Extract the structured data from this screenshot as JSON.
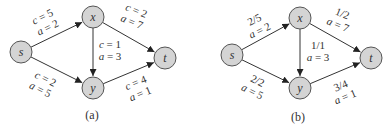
{
  "diagrams": [
    {
      "id": "a",
      "caption": "(a)",
      "caption_pos": [
        92,
        119
      ],
      "nodes": [
        {
          "id": "s",
          "label": "s",
          "x": 21,
          "y": 52
        },
        {
          "id": "x",
          "label": "x",
          "x": 93,
          "y": 17
        },
        {
          "id": "y",
          "label": "y",
          "x": 93,
          "y": 88
        },
        {
          "id": "t",
          "label": "t",
          "x": 165,
          "y": 58
        }
      ],
      "edges": [
        {
          "from": "s",
          "to": "x",
          "line1": "c = 5",
          "line2": "a = 2",
          "label_pos": [
            44,
            20
          ],
          "rotate": -26
        },
        {
          "from": "s",
          "to": "y",
          "line1": "c = 2",
          "line2": "a = 5",
          "label_pos": [
            44,
            82
          ],
          "rotate": 26
        },
        {
          "from": "x",
          "to": "y",
          "line1": "c = 1",
          "line2": "a = 3",
          "label_pos": [
            110,
            48
          ],
          "rotate": 0
        },
        {
          "from": "x",
          "to": "t",
          "line1": "c = 2",
          "line2": "a = 7",
          "label_pos": [
            135,
            14
          ],
          "rotate": 22
        },
        {
          "from": "y",
          "to": "t",
          "line1": "c = 4",
          "line2": "a = 1",
          "label_pos": [
            137,
            86
          ],
          "rotate": -22
        }
      ]
    },
    {
      "id": "b",
      "caption": "(b)",
      "caption_pos": [
        298,
        121
      ],
      "nodes": [
        {
          "id": "s",
          "label": "s",
          "x": 232,
          "y": 55
        },
        {
          "id": "x",
          "label": "x",
          "x": 300,
          "y": 18
        },
        {
          "id": "y",
          "label": "y",
          "x": 300,
          "y": 88
        },
        {
          "id": "t",
          "label": "t",
          "x": 371,
          "y": 58
        }
      ],
      "edges": [
        {
          "from": "s",
          "to": "x",
          "line1": "2/5",
          "line2": "a = 2",
          "label_pos": [
            256,
            23
          ],
          "rotate": -26
        },
        {
          "from": "s",
          "to": "y",
          "line1": "2/2",
          "line2": "a = 5",
          "label_pos": [
            256,
            84
          ],
          "rotate": 26
        },
        {
          "from": "x",
          "to": "y",
          "line1": "1/1",
          "line2": "a = 3",
          "label_pos": [
            318,
            49
          ],
          "rotate": 0
        },
        {
          "from": "x",
          "to": "t",
          "line1": "1/2",
          "line2": "a = 7",
          "label_pos": [
            341,
            17
          ],
          "rotate": 22
        },
        {
          "from": "y",
          "to": "t",
          "line1": "3/4",
          "line2": "a = 1",
          "label_pos": [
            342,
            89
          ],
          "rotate": -22
        }
      ]
    }
  ],
  "style": {
    "node_fill": "#d4d4d4",
    "node_stroke": "#555555",
    "edge_color": "#333333",
    "text_color": "#333333",
    "node_radius": 11
  }
}
